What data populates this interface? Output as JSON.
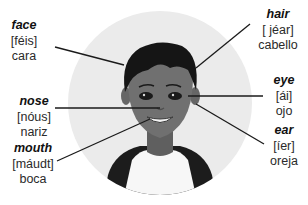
{
  "diagram": {
    "colors": {
      "circle_bg": "#ebebeb",
      "leader_line": "#1a1a1a",
      "hair": "#151515",
      "skin": "#6e6e6e",
      "shirt": "#f7f7f7",
      "jacket": "#1c1c1c"
    },
    "labels": [
      {
        "id": "face",
        "english": "face",
        "pronunciation": "[féis]",
        "spanish": "cara"
      },
      {
        "id": "hair",
        "english": "hair",
        "pronunciation": "[ jéar]",
        "spanish": "cabello"
      },
      {
        "id": "eye",
        "english": "eye",
        "pronunciation": "[ái]",
        "spanish": "ojo"
      },
      {
        "id": "nose",
        "english": "nose",
        "pronunciation": "[nóus]",
        "spanish": "nariz"
      },
      {
        "id": "mouth",
        "english": "mouth",
        "pronunciation": "[máudt]",
        "spanish": "boca"
      },
      {
        "id": "ear",
        "english": "ear",
        "pronunciation": "[íer]",
        "spanish": "oreja"
      }
    ]
  }
}
